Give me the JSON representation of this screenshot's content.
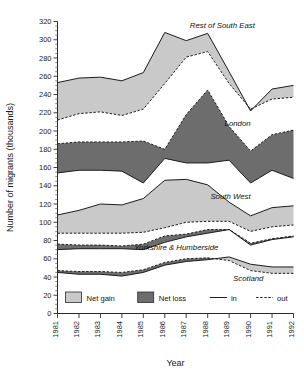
{
  "chart_data": {
    "type": "area",
    "title": "",
    "xlabel": "Year",
    "ylabel": "Number of migrants (thousands)",
    "x": [
      1981,
      1982,
      1983,
      1984,
      1985,
      1986,
      1987,
      1988,
      1989,
      1990,
      1991,
      1992
    ],
    "categories": [
      "1981",
      "1982",
      "1983",
      "1984",
      "1985",
      "1986",
      "1987",
      "1988",
      "1989",
      "1990",
      "1991",
      "1992"
    ],
    "ylim": [
      0,
      320
    ],
    "ytick_step": 20,
    "yminor_step": 5,
    "ytick_labels": [
      "0",
      "20",
      "40",
      "60",
      "80",
      "100",
      "120",
      "140",
      "160",
      "180",
      "200",
      "220",
      "240",
      "260",
      "280",
      "300",
      "320"
    ],
    "grid": false,
    "legend_position": "bottom-left",
    "legend": [
      {
        "key": "net_gain",
        "label": "Net gain",
        "type": "swatch",
        "color": "#c9c9c9"
      },
      {
        "key": "net_loss",
        "label": "Net loss",
        "type": "swatch",
        "color": "#6d6d6d"
      },
      {
        "key": "in",
        "label": "in",
        "type": "line-solid",
        "color": "#1c1c1c"
      },
      {
        "key": "out",
        "label": "out",
        "type": "line-dashed",
        "color": "#1c1c1c"
      }
    ],
    "series": [
      {
        "name": "Rest of South East",
        "fill": "net_gain",
        "label_x": 1990.2,
        "label_y": 313,
        "in": [
          253,
          258,
          259,
          255,
          264,
          308,
          299,
          307,
          265,
          222,
          246,
          250
        ],
        "out": [
          212,
          219,
          221,
          217,
          224,
          252,
          281,
          287,
          252,
          224,
          235,
          237
        ]
      },
      {
        "name": "London",
        "fill": "net_loss",
        "label_x": 1990.0,
        "label_y": 205,
        "in": [
          154,
          157,
          157,
          156,
          143,
          170,
          165,
          165,
          168,
          143,
          157,
          148
        ],
        "out": [
          186,
          188,
          188,
          188,
          189,
          180,
          218,
          245,
          205,
          178,
          196,
          201
        ]
      },
      {
        "name": "South West",
        "fill": "net_gain",
        "label_x": 1990.0,
        "label_y": 126,
        "in": [
          108,
          113,
          120,
          119,
          126,
          146,
          147,
          141,
          122,
          107,
          116,
          118
        ],
        "out": [
          88,
          88,
          88,
          88,
          89,
          94,
          100,
          101,
          101,
          90,
          95,
          97
        ]
      },
      {
        "name": "Yorkshire & Humberside",
        "fill": "net_loss",
        "label_x": 1988.5,
        "label_y": 70,
        "in": [
          70,
          71,
          71,
          71,
          70,
          78,
          84,
          88,
          92,
          75,
          81,
          84
        ],
        "out": [
          76,
          75,
          75,
          74,
          76,
          85,
          87,
          92,
          92,
          77,
          82,
          85
        ]
      },
      {
        "name": "Scotland",
        "fill": "mixed",
        "label_x": 1990.6,
        "label_y": 36,
        "in": [
          45,
          43,
          43,
          41,
          45,
          53,
          57,
          59,
          62,
          54,
          51,
          51
        ],
        "out": [
          47,
          46,
          46,
          45,
          48,
          56,
          60,
          61,
          58,
          47,
          44,
          44
        ]
      }
    ],
    "notes": {
      "net_gain_rule": "light band where 'in' exceeds 'out'",
      "net_loss_rule": "dark band where 'out' exceeds 'in'"
    }
  }
}
